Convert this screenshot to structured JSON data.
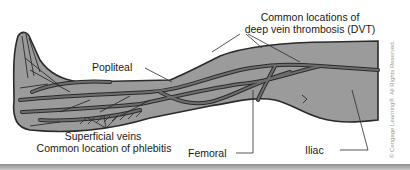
{
  "figure": {
    "labels": {
      "dvt_line1": "Common locations of",
      "dvt_line2": "deep vein thrombosis (DVT)",
      "popliteal": "Popliteal",
      "superficial_line1": "Superficial veins",
      "superficial_line2": "Common location of phlebitis",
      "femoral": "Femoral",
      "iliac": "Iliac"
    },
    "copyright": "© Cengage Learning®. All Rights Reserved.",
    "colors": {
      "leg_fill": "#9b9b9b",
      "outline": "#2b2b2b",
      "vein_fill": "#6e6e6e",
      "text": "#1a1a1a"
    }
  }
}
